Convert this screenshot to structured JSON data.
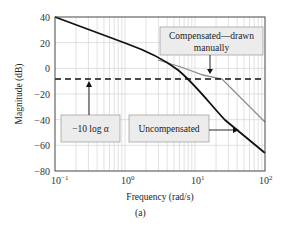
{
  "chart_data": {
    "type": "line",
    "title": "",
    "xlabel": "Frequency (rad/s)",
    "ylabel": "Magnitude (dB)",
    "xscale": "log",
    "xlim": [
      0.1,
      100
    ],
    "ylim": [
      -80,
      40
    ],
    "grid": true,
    "x_tick_labels": [
      "10^-1",
      "10^0",
      "10^1",
      "10^2"
    ],
    "y_tick_labels": [
      "40",
      "20",
      "0",
      "−20",
      "−40",
      "−60",
      "−80"
    ],
    "series": [
      {
        "name": "Uncompensated",
        "color": "#111111",
        "style": "solid",
        "x": [
          0.1,
          0.3,
          1,
          2,
          4,
          8,
          15,
          30,
          60,
          100
        ],
        "y": [
          40,
          30.5,
          20,
          13.5,
          5,
          -7,
          -19,
          -35,
          -53,
          -66
        ]
      },
      {
        "name": "Compensated — drawn manually",
        "color": "#8a8a8a",
        "style": "solid",
        "x": [
          3,
          6,
          12,
          20,
          100
        ],
        "y": [
          9,
          3,
          -4,
          -8,
          -42
        ]
      },
      {
        "name": "-10 log α",
        "color": "#111111",
        "style": "dashed",
        "x": [
          0.1,
          100
        ],
        "y": [
          -8,
          -8
        ]
      }
    ],
    "annotations": [
      {
        "text": "Compensated—drawn manually",
        "arrow_to": {
          "x": 12,
          "y": -6
        }
      },
      {
        "text": "−10 log α",
        "arrow_to": {
          "x": 0.28,
          "y": -8
        }
      },
      {
        "text": "Uncompensated",
        "arrow_to": {
          "x": 42,
          "y": -44
        }
      }
    ],
    "caption": "(a)"
  },
  "labels": {
    "xlabel": "Frequency (rad/s)",
    "ylabel": "Magnitude (dB)",
    "comp_line1": "Compensated—drawn",
    "comp_line2": "manually",
    "tenlog": "−10 log α",
    "uncomp": "Uncompensated",
    "caption": "(a)",
    "yticks": [
      "40",
      "20",
      "0",
      "−20",
      "−40",
      "−60",
      "−80"
    ]
  }
}
